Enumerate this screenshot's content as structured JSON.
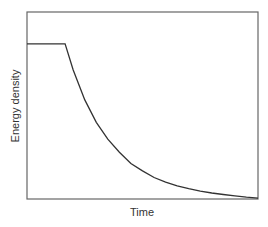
{
  "chart_data": {
    "type": "line",
    "title": "",
    "xlabel": "Time",
    "ylabel": "Energy density",
    "grid": false,
    "legend": null,
    "xticks": [],
    "yticks": [],
    "xlim": [
      0,
      1
    ],
    "ylim": [
      0,
      1
    ],
    "series": [
      {
        "name": "Energy density",
        "color": "#333333",
        "x": [
          0.0,
          0.165,
          0.2,
          0.25,
          0.3,
          0.35,
          0.4,
          0.45,
          0.5,
          0.55,
          0.6,
          0.65,
          0.7,
          0.75,
          0.8,
          0.85,
          0.9,
          0.95,
          1.0
        ],
        "y": [
          0.83,
          0.83,
          0.69,
          0.53,
          0.41,
          0.32,
          0.25,
          0.19,
          0.15,
          0.115,
          0.09,
          0.07,
          0.055,
          0.042,
          0.032,
          0.024,
          0.017,
          0.01,
          0.005
        ]
      }
    ]
  },
  "colors": {
    "frame": "#555555",
    "line": "#333333",
    "text": "#333333"
  }
}
